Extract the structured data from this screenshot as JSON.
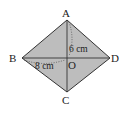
{
  "diagram": {
    "type": "rhombus",
    "fill_color": "#bdbdbd",
    "stroke_color": "#333333",
    "vertices": {
      "A": {
        "label": "A",
        "x": 67,
        "y": 20
      },
      "B": {
        "label": "B",
        "x": 22,
        "y": 58
      },
      "C": {
        "label": "C",
        "x": 67,
        "y": 92
      },
      "D": {
        "label": "D",
        "x": 110,
        "y": 58
      }
    },
    "center": {
      "label": "O",
      "x": 67,
      "y": 58
    },
    "measurements": {
      "AO": "6 cm",
      "BO": "8 cm"
    }
  }
}
